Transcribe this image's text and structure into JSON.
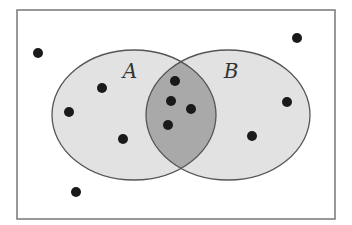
{
  "diagram": {
    "type": "venn",
    "frame": {
      "x": 17,
      "y": 10,
      "width": 318,
      "height": 209,
      "stroke": "#777777"
    },
    "colors": {
      "set_fill": "#e2e2e2",
      "intersection_fill": "#a9a9a9",
      "outline": "#555555",
      "dot": "#1a1a1a",
      "background": "#ffffff"
    },
    "sets": [
      {
        "id": "A",
        "label": "A",
        "cx": 134,
        "cy": 115,
        "rx": 82,
        "ry": 65,
        "label_x": 130,
        "label_y": 78
      },
      {
        "id": "B",
        "label": "B",
        "cx": 228,
        "cy": 115,
        "rx": 82,
        "ry": 65,
        "label_x": 231,
        "label_y": 78
      }
    ],
    "dot_radius": 5,
    "points": [
      {
        "region": "outside",
        "x": 38,
        "y": 53
      },
      {
        "region": "outside",
        "x": 297,
        "y": 38
      },
      {
        "region": "outside",
        "x": 76,
        "y": 192
      },
      {
        "region": "A_only",
        "x": 102,
        "y": 88
      },
      {
        "region": "A_only",
        "x": 69,
        "y": 112
      },
      {
        "region": "A_only",
        "x": 123,
        "y": 139
      },
      {
        "region": "A_and_B",
        "x": 175,
        "y": 81
      },
      {
        "region": "A_and_B",
        "x": 171,
        "y": 101
      },
      {
        "region": "A_and_B",
        "x": 191,
        "y": 109
      },
      {
        "region": "A_and_B",
        "x": 168,
        "y": 125
      },
      {
        "region": "B_only",
        "x": 287,
        "y": 102
      },
      {
        "region": "B_only",
        "x": 252,
        "y": 136
      }
    ],
    "counts": {
      "outside": 3,
      "A_only": 3,
      "A_and_B": 4,
      "B_only": 2,
      "total": 12
    }
  }
}
